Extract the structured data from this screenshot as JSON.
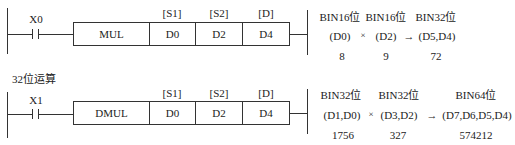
{
  "rungs": [
    {
      "contact": "X0",
      "instruction": "MUL",
      "operand_labels": [
        "[S1]",
        "[S2]",
        "[D]"
      ],
      "operands": [
        "D0",
        "D2",
        "D4"
      ],
      "explanation": {
        "types": [
          "BIN16位",
          "BIN16位",
          "BIN32位"
        ],
        "multiply_sign": "×",
        "arrow": "→",
        "regs": [
          "(D0)",
          "(D2)",
          "(D5,D4)"
        ],
        "values": [
          "8",
          "9",
          "72"
        ]
      }
    },
    {
      "section_label": "32位运算",
      "contact": "X1",
      "instruction": "DMUL",
      "operand_labels": [
        "[S1]",
        "[S2]",
        "[D]"
      ],
      "operands": [
        "D0",
        "D2",
        "D4"
      ],
      "explanation": {
        "types": [
          "BIN32位",
          "BIN32位",
          "BIN64位"
        ],
        "multiply_sign": "×",
        "arrow": "→",
        "regs": [
          "(D1,D0)",
          "(D3,D2)",
          "(D7,D6,D5,D4)"
        ],
        "values": [
          "1756",
          "327",
          "574212"
        ]
      }
    }
  ]
}
